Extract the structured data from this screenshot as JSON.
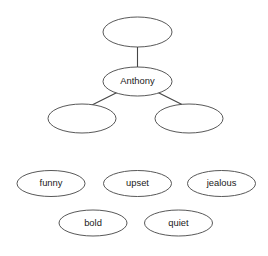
{
  "diagram": {
    "type": "concept-map",
    "background_color": "#ffffff",
    "stroke_color": "#454545",
    "text_color": "#1a1a1a",
    "tree": {
      "root": {
        "id": "root-node",
        "label": "",
        "cx": 137.5,
        "cy": 32,
        "rx": 34.5,
        "ry": 15
      },
      "center": {
        "id": "anthony-node",
        "label": "Anthony",
        "cx": 137.5,
        "cy": 81.5,
        "rx": 34.5,
        "ry": 14.5
      },
      "children": [
        {
          "id": "child-left-node",
          "label": "",
          "cx": 82,
          "cy": 118.5,
          "rx": 34,
          "ry": 14.5
        },
        {
          "id": "child-right-node",
          "label": "",
          "cx": 189,
          "cy": 118.5,
          "rx": 34,
          "ry": 14.5
        }
      ],
      "connectors": [
        {
          "id": "connector-root-to-anthony",
          "x1": 137.5,
          "y1": 47,
          "x2": 137.5,
          "y2": 67
        },
        {
          "id": "connector-anthony-to-left",
          "x1": 118,
          "y1": 92,
          "x2": 92,
          "y2": 105
        },
        {
          "id": "connector-anthony-to-right",
          "x1": 157,
          "y1": 92,
          "x2": 183,
          "y2": 105
        }
      ]
    },
    "word_bank": {
      "rows": [
        [
          {
            "id": "word-funny",
            "label": "funny",
            "cx": 51,
            "cy": 183.5,
            "rx": 34,
            "ry": 13
          },
          {
            "id": "word-upset",
            "label": "upset",
            "cx": 137.5,
            "cy": 183.5,
            "rx": 34,
            "ry": 13
          },
          {
            "id": "word-jealous",
            "label": "jealous",
            "cx": 221.5,
            "cy": 183.5,
            "rx": 34,
            "ry": 13
          }
        ],
        [
          {
            "id": "word-bold",
            "label": "bold",
            "cx": 93,
            "cy": 223,
            "rx": 34,
            "ry": 13
          },
          {
            "id": "word-quiet",
            "label": "quiet",
            "cx": 178.5,
            "cy": 223,
            "rx": 34,
            "ry": 13
          }
        ]
      ]
    }
  }
}
